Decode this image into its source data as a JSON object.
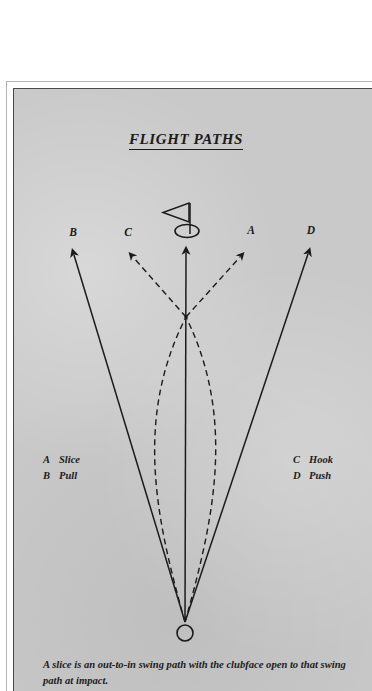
{
  "figure": {
    "title": "FLIGHT PATHS",
    "caption": "A slice is an out-to-in swing path with the clubface open to that swing path at impact."
  },
  "labels": {
    "A": "A",
    "B": "B",
    "C": "C",
    "D": "D"
  },
  "legend": {
    "left": [
      {
        "key": "A",
        "name": "Slice"
      },
      {
        "key": "B",
        "name": "Pull"
      }
    ],
    "right": [
      {
        "key": "C",
        "name": "Hook"
      },
      {
        "key": "D",
        "name": "Push"
      }
    ]
  },
  "colors": {
    "paper": "#c9c9c9",
    "ink": "#1b1b1b",
    "frame": "#4a4a4a",
    "page": "#ffffff"
  },
  "diagram": {
    "type": "golf-ball-flight-paths",
    "ball": {
      "label": "ball at address",
      "x": 171,
      "y": 544,
      "r": 8
    },
    "target": {
      "label": "hole with flag",
      "x": 172,
      "y": 142,
      "flag_direction": "left"
    },
    "paths": [
      {
        "key": "A",
        "name": "Slice",
        "style": "dashed",
        "shape": "curves-left-then-bends-right",
        "ends_at_letter": "A"
      },
      {
        "key": "B",
        "name": "Pull",
        "style": "solid",
        "shape": "straight-left",
        "ends_at_letter": "B"
      },
      {
        "key": "C",
        "name": "Hook",
        "style": "dashed",
        "shape": "curves-right-then-bends-left",
        "ends_at_letter": "C"
      },
      {
        "key": "D",
        "name": "Push",
        "style": "solid",
        "shape": "straight-right",
        "ends_at_letter": "D"
      },
      {
        "key": "target-line",
        "name": "Target line",
        "style": "solid",
        "shape": "straight-vertical-to-hole",
        "ends_at_letter": ""
      }
    ]
  }
}
